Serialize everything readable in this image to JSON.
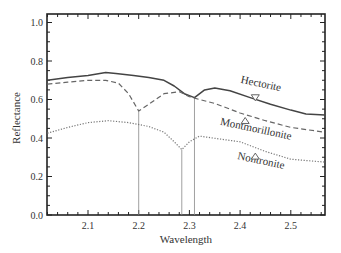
{
  "chart_data": {
    "type": "line",
    "title": "",
    "xlabel": "Wavelength",
    "ylabel": "Reflectance",
    "xlim": [
      2.02,
      2.567
    ],
    "ylim": [
      0.0,
      1.04
    ],
    "xticks": [
      2.1,
      2.2,
      2.3,
      2.4,
      2.5
    ],
    "xtick_labels": [
      "2.1",
      "2.2",
      "2.3",
      "2.4",
      "2.5"
    ],
    "yticks": [
      0.0,
      0.2,
      0.4,
      0.6,
      0.8,
      1.0
    ],
    "ytick_labels": [
      "0.0",
      "0.2",
      "0.4",
      "0.6",
      "0.8",
      "1.0"
    ],
    "grid": false,
    "legend": "inline labels",
    "series": [
      {
        "name": "Hectorite",
        "style": "solid",
        "x": [
          2.02,
          2.06,
          2.1,
          2.135,
          2.155,
          2.19,
          2.22,
          2.25,
          2.27,
          2.29,
          2.31,
          2.33,
          2.35,
          2.38,
          2.42,
          2.46,
          2.5,
          2.53,
          2.567
        ],
        "y": [
          0.7,
          0.715,
          0.725,
          0.74,
          0.735,
          0.725,
          0.715,
          0.7,
          0.67,
          0.63,
          0.61,
          0.65,
          0.66,
          0.645,
          0.61,
          0.575,
          0.545,
          0.525,
          0.52
        ],
        "label_pos": {
          "x": 2.44,
          "y": 0.665
        },
        "marker": {
          "shape": "triangle-down",
          "x": 2.43,
          "y": 0.61
        }
      },
      {
        "name": "Montmorillonite",
        "style": "dashed",
        "x": [
          2.02,
          2.06,
          2.1,
          2.135,
          2.16,
          2.18,
          2.2,
          2.22,
          2.25,
          2.28,
          2.3,
          2.32,
          2.35,
          2.4,
          2.45,
          2.5,
          2.567
        ],
        "y": [
          0.68,
          0.69,
          0.7,
          0.7,
          0.685,
          0.63,
          0.54,
          0.575,
          0.63,
          0.64,
          0.615,
          0.6,
          0.58,
          0.53,
          0.49,
          0.455,
          0.43
        ],
        "label_pos": {
          "x": 2.43,
          "y": 0.43
        },
        "marker": {
          "shape": "triangle-up",
          "x": 2.41,
          "y": 0.49
        }
      },
      {
        "name": "Nontronite",
        "style": "dotted",
        "x": [
          2.02,
          2.06,
          2.1,
          2.14,
          2.18,
          2.22,
          2.25,
          2.27,
          2.285,
          2.3,
          2.32,
          2.36,
          2.4,
          2.45,
          2.5,
          2.567
        ],
        "y": [
          0.425,
          0.455,
          0.48,
          0.49,
          0.48,
          0.46,
          0.43,
          0.38,
          0.34,
          0.38,
          0.41,
          0.395,
          0.38,
          0.33,
          0.29,
          0.275
        ],
        "label_pos": {
          "x": 2.44,
          "y": 0.265
        },
        "marker": {
          "shape": "triangle-up",
          "x": 2.43,
          "y": 0.305
        }
      }
    ],
    "annotations": [
      {
        "type": "vline",
        "x": 2.2,
        "from_y": 0.0,
        "to_y": 0.54
      },
      {
        "type": "vline",
        "x": 2.285,
        "from_y": 0.0,
        "to_y": 0.34
      },
      {
        "type": "vline",
        "x": 2.31,
        "from_y": 0.0,
        "to_y": 0.61
      }
    ]
  }
}
